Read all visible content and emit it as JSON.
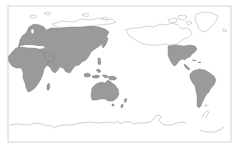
{
  "map": {
    "projection": "pacific-centered world map",
    "colors": {
      "background": "#ffffff",
      "shaded_land": "#9a9a9a",
      "shaded_stroke": "#7a7a7a",
      "outline_land": "#a8a8a8",
      "frame": "#c8c8c8"
    },
    "shaded_regions": [
      "Europe",
      "Asia",
      "Africa",
      "Southeast Asia / Indonesia",
      "Australia",
      "Southern North America (USA/Mexico)",
      "Central America",
      "South America"
    ],
    "outline_only_regions": [
      "Greenland",
      "Canada / Arctic Archipelago",
      "Alaska",
      "Siberian Arctic coast",
      "Antarctica",
      "Svalbard / Franz Josef Land"
    ]
  }
}
